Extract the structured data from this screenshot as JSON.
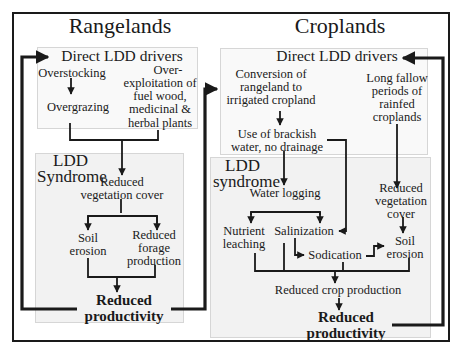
{
  "colors": {
    "line": "#1a1a1a",
    "frame_border": "#1a1a1a",
    "box_border": "#d6d6d6",
    "drivers_box_bg": "#f9f9f9",
    "syndrome_box_bg": "#f2f2f2",
    "background": "#ffffff"
  },
  "rangelands": {
    "title": "Rangelands",
    "drivers": {
      "heading": "Direct LDD drivers",
      "overstocking": "Overstocking",
      "overgrazing": "Overgrazing",
      "overexploitation": [
        "Over-",
        "exploitation of",
        "fuel wood,",
        "medicinal &",
        "herbal plants"
      ]
    },
    "syndrome": {
      "heading": [
        "LDD",
        "Syndrome"
      ],
      "reduced_vegetation_cover": [
        "Reduced",
        "vegetation cover"
      ],
      "soil_erosion": [
        "Soil",
        "erosion"
      ],
      "reduced_forage_production": [
        "Reduced",
        "forage",
        "production"
      ],
      "reduced_productivity": [
        "Reduced",
        "productivity"
      ]
    }
  },
  "croplands": {
    "title": "Croplands",
    "drivers": {
      "heading": "Direct LDD drivers",
      "conversion": [
        "Conversion of",
        "rangeland to",
        "irrigated cropland"
      ],
      "brackish_water": [
        "Use of brackish",
        "water, no drainage"
      ],
      "long_fallow": [
        "Long fallow",
        "periods of",
        "rainfed",
        "croplands"
      ]
    },
    "syndrome": {
      "heading": [
        "LDD",
        "syndrome"
      ],
      "water_logging": "Water logging",
      "nutrient_leaching": [
        "Nutrient",
        "leaching"
      ],
      "salinization": "Salinization",
      "sodication": "Sodication",
      "reduced_vegetation_cover": [
        "Reduced",
        "vegetation",
        "cover"
      ],
      "soil_erosion": [
        "Soil",
        "erosion"
      ],
      "reduced_crop_production": "Reduced crop production",
      "reduced_productivity": [
        "Reduced",
        "productivity"
      ]
    }
  }
}
